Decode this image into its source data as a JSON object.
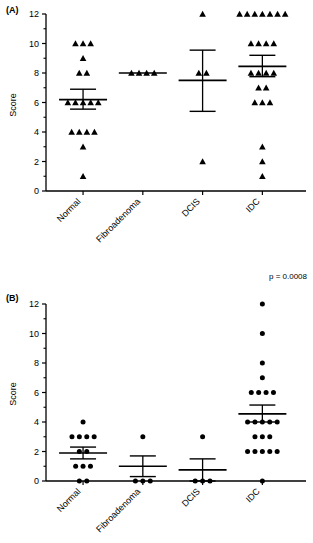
{
  "figure": {
    "panels": [
      {
        "id": "A",
        "label": "(A)",
        "marker": "triangle",
        "annotation": "",
        "chart_data": {
          "type": "scatter",
          "title": "",
          "xlabel": "",
          "ylabel": "Score",
          "ylim": [
            0,
            12
          ],
          "yticks": [
            0,
            2,
            4,
            6,
            8,
            10,
            12
          ],
          "yticklabels": [
            "0",
            "2",
            "4",
            "6",
            "8",
            "10",
            "12"
          ],
          "yminorticks": [
            1,
            3,
            5,
            7,
            9,
            11
          ],
          "categories": [
            "Normal",
            "Fibroadenoma",
            "DCIS",
            "IDC"
          ],
          "grid": false,
          "legend": null,
          "series": [
            {
              "name": "Normal",
              "values": [
                10,
                10,
                10,
                9,
                8,
                8,
                6,
                6,
                6,
                6,
                6,
                4,
                4,
                4,
                4,
                3,
                1
              ],
              "mean": 6.2,
              "sem_low": 5.55,
              "sem_high": 6.9
            },
            {
              "name": "Fibroadenoma",
              "values": [
                8,
                8,
                8,
                8
              ],
              "mean": 8.0,
              "sem_low": 8.0,
              "sem_high": 8.0
            },
            {
              "name": "DCIS",
              "values": [
                12,
                8,
                8,
                2
              ],
              "mean": 7.5,
              "sem_low": 5.4,
              "sem_high": 9.55
            },
            {
              "name": "IDC",
              "values": [
                12,
                12,
                12,
                12,
                12,
                12,
                12,
                10,
                10,
                10,
                10,
                8,
                8,
                8,
                8,
                7,
                7,
                6,
                6,
                6,
                3,
                2,
                1
              ],
              "mean": 8.45,
              "sem_low": 7.75,
              "sem_high": 9.2
            }
          ]
        }
      },
      {
        "id": "B",
        "label": "(B)",
        "marker": "circle",
        "annotation": "p = 0.0008",
        "chart_data": {
          "type": "scatter",
          "title": "",
          "xlabel": "",
          "ylabel": "Score",
          "ylim": [
            0,
            12
          ],
          "yticks": [
            0,
            2,
            4,
            6,
            8,
            10,
            12
          ],
          "yticklabels": [
            "0",
            "2",
            "4",
            "6",
            "8",
            "10",
            "12"
          ],
          "yminorticks": [
            1,
            3,
            5,
            7,
            9,
            11
          ],
          "categories": [
            "Normal",
            "Fibroadenoma",
            "DCIS",
            "IDC"
          ],
          "grid": false,
          "legend": null,
          "series": [
            {
              "name": "Normal",
              "values": [
                4,
                3,
                3,
                3,
                3,
                2,
                2,
                1,
                1,
                1,
                0,
                0
              ],
              "mean": 1.9,
              "sem_low": 1.5,
              "sem_high": 2.3
            },
            {
              "name": "Fibroadenoma",
              "values": [
                3,
                0,
                0,
                0
              ],
              "mean": 1.0,
              "sem_low": 0.3,
              "sem_high": 1.7
            },
            {
              "name": "DCIS",
              "values": [
                3,
                0,
                0,
                0
              ],
              "mean": 0.75,
              "sem_low": 0.0,
              "sem_high": 1.5
            },
            {
              "name": "IDC",
              "values": [
                12,
                10,
                8,
                7,
                6,
                6,
                6,
                6,
                4,
                4,
                4,
                4,
                4,
                3,
                3,
                3,
                2,
                2,
                2,
                2,
                2,
                0
              ],
              "mean": 4.55,
              "sem_low": 4.0,
              "sem_high": 5.15
            }
          ]
        }
      }
    ]
  }
}
